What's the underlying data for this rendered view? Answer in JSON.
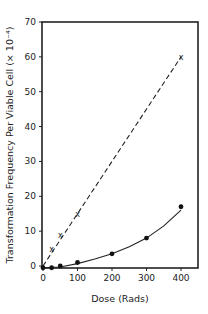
{
  "chart_data": {
    "type": "line",
    "title": "",
    "xlabel": "Dose    (Rads)",
    "ylabel": "Transformation Frequency Per Viable Cell (× 10⁻⁴)",
    "xlim": [
      0,
      450
    ],
    "ylim": [
      -1,
      70
    ],
    "x_ticks": [
      0,
      100,
      200,
      300,
      400
    ],
    "y_ticks": [
      0,
      10,
      20,
      30,
      40,
      50,
      60,
      70
    ],
    "grid": false,
    "legend": null,
    "series": [
      {
        "name": "x-markers (dashed line)",
        "marker": "x",
        "line_style": "dashed",
        "x": [
          25,
          50,
          100,
          400
        ],
        "y": [
          5,
          9,
          15,
          60
        ],
        "fit_line": {
          "x": [
            0,
            400
          ],
          "y": [
            0,
            60
          ]
        }
      },
      {
        "name": "filled circles (solid curve)",
        "marker": "filled-circle",
        "line_style": "solid",
        "x": [
          0,
          25,
          50,
          100,
          200,
          300,
          400
        ],
        "y": [
          -0.5,
          -0.5,
          0,
          1,
          3.5,
          8,
          17
        ]
      }
    ]
  },
  "labels": {
    "xlabel": "Dose    (Rads)",
    "ylabel": "Transformation Frequency Per Viable Cell  (× 10⁻⁴)",
    "x_tick_labels": [
      "0",
      "100",
      "200",
      "300",
      "400"
    ],
    "y_tick_labels": [
      "0",
      "10",
      "20",
      "30",
      "40",
      "50",
      "60",
      "70"
    ]
  }
}
